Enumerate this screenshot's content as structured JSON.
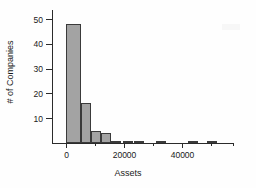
{
  "chart_data": {
    "type": "bar",
    "title": "",
    "subtitle": "",
    "xlabel": "Assets",
    "ylabel": "# of Companies",
    "xlim": [
      -3000,
      60000
    ],
    "ylim": [
      0,
      50
    ],
    "grid": false,
    "legend": null,
    "bin_width": 2500,
    "x_ticks": [
      0,
      20000,
      40000
    ],
    "x_tick_labels": [
      "0",
      "20000",
      "40000"
    ],
    "x_minor_ticks": [
      10000,
      30000,
      50000,
      57500
    ],
    "y_ticks": [
      10,
      20,
      30,
      40,
      50
    ],
    "y_tick_labels": [
      "10",
      "20",
      "30",
      "40",
      "50"
    ],
    "bin_starts": [
      0,
      2500,
      5000,
      7500,
      10000,
      12500,
      15000,
      17500,
      20000,
      22500,
      25000,
      27500,
      30000,
      32500,
      35000,
      37500,
      40000,
      42500,
      45000,
      47500,
      50000,
      52500
    ],
    "values": [
      48,
      48,
      16,
      16,
      5,
      5,
      4,
      4,
      1,
      1,
      1,
      0,
      0,
      1,
      1,
      0,
      0,
      0,
      1,
      1,
      0,
      1
    ],
    "bars": [
      {
        "x0": 0,
        "x1": 5000,
        "value": 48
      },
      {
        "x0": 5000,
        "x1": 8500,
        "value": 16
      },
      {
        "x0": 8500,
        "x1": 12000,
        "value": 5
      },
      {
        "x0": 12000,
        "x1": 15500,
        "value": 4
      },
      {
        "x0": 15500,
        "x1": 19000,
        "value": 1
      },
      {
        "x0": 19500,
        "x1": 23000,
        "value": 1
      },
      {
        "x0": 23500,
        "x1": 27000,
        "value": 1
      },
      {
        "x0": 31000,
        "x1": 34500,
        "value": 1
      },
      {
        "x0": 42000,
        "x1": 45500,
        "value": 1
      },
      {
        "x0": 48500,
        "x1": 52000,
        "value": 1
      }
    ],
    "bar_fill_color": "#a3a3a3",
    "bar_edge_color": "#3a3a3a",
    "axis_color": "#2b2b2b",
    "background_color": "#ffffff"
  }
}
